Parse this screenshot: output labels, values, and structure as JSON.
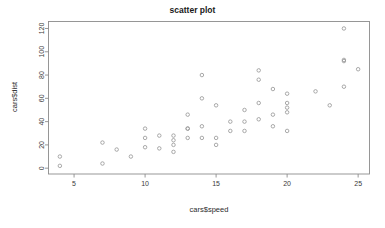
{
  "chart_data": {
    "type": "scatter",
    "title": "scatter plot",
    "xlabel": "cars$speed",
    "ylabel": "cars$dist",
    "grid": false,
    "legend": false,
    "xlim": [
      3.2,
      25.8
    ],
    "ylim": [
      -5,
      126
    ],
    "xticks": [
      5,
      10,
      15,
      20,
      25
    ],
    "yticks": [
      0,
      20,
      40,
      60,
      80,
      100,
      120
    ],
    "point_symbol": "open-circle",
    "point_color": "#9a9a9a",
    "series": [
      {
        "name": "cars",
        "x": [
          4,
          4,
          7,
          7,
          8,
          9,
          10,
          10,
          10,
          11,
          11,
          12,
          12,
          12,
          12,
          13,
          13,
          13,
          13,
          14,
          14,
          14,
          14,
          15,
          15,
          15,
          16,
          16,
          17,
          17,
          17,
          18,
          18,
          18,
          18,
          19,
          19,
          19,
          20,
          20,
          20,
          20,
          20,
          22,
          23,
          24,
          24,
          24,
          24,
          25
        ],
        "y": [
          2,
          10,
          4,
          22,
          16,
          10,
          18,
          26,
          34,
          17,
          28,
          14,
          20,
          24,
          28,
          26,
          34,
          34,
          46,
          26,
          36,
          60,
          80,
          20,
          26,
          54,
          32,
          40,
          32,
          40,
          50,
          42,
          56,
          76,
          84,
          36,
          46,
          68,
          32,
          48,
          52,
          56,
          64,
          66,
          54,
          70,
          92,
          93,
          120,
          85
        ]
      }
    ]
  },
  "axis_tick_labels": {
    "x": [
      "5",
      "10",
      "15",
      "20",
      "25"
    ],
    "y": [
      "0",
      "20",
      "40",
      "60",
      "80",
      "100",
      "120"
    ]
  }
}
